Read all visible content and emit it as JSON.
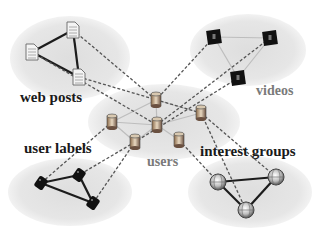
{
  "colors": {
    "background": "#ffffff",
    "cluster_fill": "#e4e4e4",
    "solid_edge": "#1c1c1c",
    "light_edge": "#b8b8b8",
    "dashed_edge": "#555555",
    "dark_label": "#1a1a1a",
    "grey_label": "#7a7a7a"
  },
  "clusters": [
    {
      "id": "web_posts",
      "label": "web posts",
      "icon": "document-icon",
      "label_style": "dark"
    },
    {
      "id": "videos",
      "label": "videos",
      "icon": "video-icon",
      "label_style": "grey"
    },
    {
      "id": "users",
      "label": "users",
      "icon": "user-database-icon",
      "label_style": "grey"
    },
    {
      "id": "user_labels",
      "label": "user labels",
      "icon": "tag-icon",
      "label_style": "dark"
    },
    {
      "id": "interest_groups",
      "label": "interest groups",
      "icon": "globe-icon",
      "label_style": "dark"
    }
  ],
  "nodes": {
    "web_posts": [
      [
        32,
        52
      ],
      [
        73,
        30
      ],
      [
        79,
        77
      ]
    ],
    "videos": [
      [
        214,
        37
      ],
      [
        270,
        38
      ],
      [
        238,
        78
      ]
    ],
    "users": [
      [
        156,
        100
      ],
      [
        157,
        125
      ],
      [
        112,
        122
      ],
      [
        135,
        142
      ],
      [
        201,
        113
      ],
      [
        179,
        140
      ]
    ],
    "user_labels": [
      [
        41,
        183
      ],
      [
        79,
        175
      ],
      [
        93,
        203
      ]
    ],
    "interest_groups": [
      [
        218,
        182
      ],
      [
        276,
        177
      ],
      [
        246,
        210
      ]
    ]
  },
  "edges": {
    "intra_solid": [
      [
        "web_posts",
        0,
        "web_posts",
        1
      ],
      [
        "web_posts",
        0,
        "web_posts",
        2
      ],
      [
        "web_posts",
        1,
        "web_posts",
        2
      ],
      [
        "user_labels",
        0,
        "user_labels",
        1
      ],
      [
        "user_labels",
        0,
        "user_labels",
        2
      ],
      [
        "user_labels",
        1,
        "user_labels",
        2
      ],
      [
        "interest_groups",
        0,
        "interest_groups",
        1
      ],
      [
        "interest_groups",
        0,
        "interest_groups",
        2
      ],
      [
        "interest_groups",
        1,
        "interest_groups",
        2
      ]
    ],
    "intra_light": [
      [
        "videos",
        0,
        "videos",
        1
      ],
      [
        "videos",
        0,
        "videos",
        2
      ],
      [
        "videos",
        1,
        "videos",
        2
      ],
      [
        "users",
        0,
        "users",
        1
      ],
      [
        "users",
        0,
        "users",
        2
      ],
      [
        "users",
        0,
        "users",
        4
      ],
      [
        "users",
        1,
        "users",
        2
      ],
      [
        "users",
        1,
        "users",
        3
      ],
      [
        "users",
        1,
        "users",
        4
      ],
      [
        "users",
        1,
        "users",
        5
      ],
      [
        "users",
        2,
        "users",
        3
      ]
    ],
    "cross_dashed": [
      [
        "web_posts",
        0,
        "users",
        1
      ],
      [
        "web_posts",
        1,
        "users",
        0
      ],
      [
        "web_posts",
        2,
        "users",
        4
      ],
      [
        "videos",
        0,
        "users",
        0
      ],
      [
        "videos",
        1,
        "users",
        1
      ],
      [
        "videos",
        2,
        "users",
        3
      ],
      [
        "users",
        2,
        "user_labels",
        0
      ],
      [
        "users",
        3,
        "user_labels",
        1
      ],
      [
        "users",
        3,
        "user_labels",
        2
      ],
      [
        "users",
        4,
        "interest_groups",
        1
      ],
      [
        "users",
        4,
        "interest_groups",
        2
      ],
      [
        "users",
        5,
        "interest_groups",
        0
      ]
    ]
  }
}
